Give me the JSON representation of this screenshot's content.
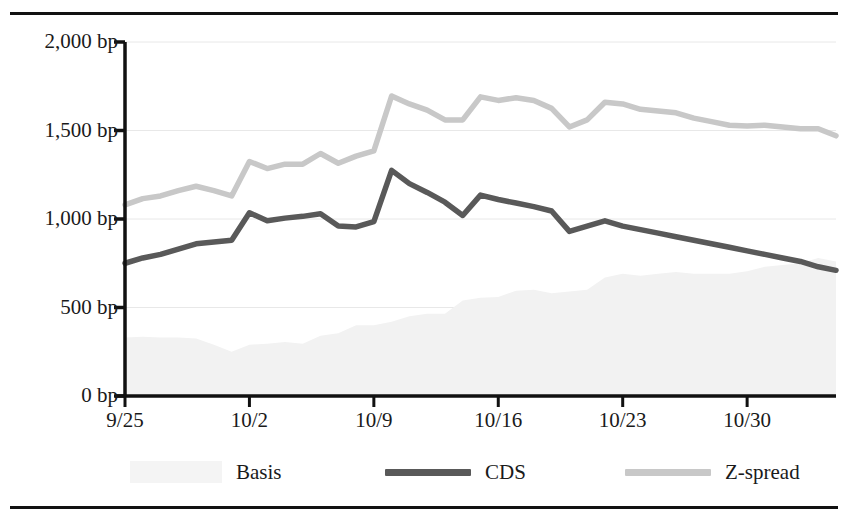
{
  "chart_data": {
    "type": "line",
    "title": "",
    "subtitle": "",
    "xlabel": "",
    "ylabel": "",
    "ylim": [
      0,
      2000
    ],
    "grid": true,
    "legend_position": "bottom",
    "y_ticks": [
      0,
      500,
      1000,
      1500,
      2000
    ],
    "y_tick_labels": [
      "0 bp",
      "500 bp",
      "1,000 bp",
      "1,500 bp",
      "2,000 bp"
    ],
    "x_ticks": [
      0,
      7,
      14,
      21,
      28,
      35
    ],
    "x_tick_labels": [
      "9/25",
      "10/2",
      "10/9",
      "10/16",
      "10/23",
      "10/30"
    ],
    "x_unit": "days since 9/25",
    "x_range": [
      0,
      40
    ],
    "x": [
      0,
      1,
      2,
      3,
      4,
      5,
      6,
      7,
      8,
      9,
      10,
      11,
      12,
      13,
      14,
      15,
      16,
      17,
      18,
      19,
      20,
      21,
      22,
      23,
      24,
      25,
      26,
      27,
      28,
      29,
      30,
      31,
      32,
      33,
      34,
      35,
      36,
      37,
      38,
      39,
      40
    ],
    "series": [
      {
        "name": "Basis",
        "type": "area",
        "color": "#f2f2f2",
        "note": "Z-spread minus CDS, shown as a very faint shaded area",
        "values": [
          330,
          335,
          330,
          330,
          325,
          290,
          250,
          290,
          295,
          305,
          295,
          340,
          355,
          400,
          400,
          420,
          450,
          465,
          465,
          540,
          555,
          560,
          595,
          600,
          580,
          590,
          600,
          670,
          690,
          680,
          690,
          700,
          690,
          690,
          690,
          705,
          730,
          740,
          750,
          780,
          760
        ]
      },
      {
        "name": "CDS",
        "type": "line",
        "color": "#595959",
        "values": [
          750,
          780,
          800,
          830,
          860,
          870,
          880,
          1035,
          990,
          1005,
          1015,
          1030,
          960,
          955,
          985,
          1275,
          1200,
          1150,
          1095,
          1020,
          1135,
          1110,
          1090,
          1070,
          1045,
          930,
          960,
          990,
          960,
          940,
          920,
          900,
          880,
          860,
          840,
          820,
          800,
          780,
          760,
          730,
          710
        ]
      },
      {
        "name": "Z-spread",
        "type": "line",
        "color": "#c8c8c8",
        "values": [
          1080,
          1115,
          1130,
          1160,
          1185,
          1160,
          1130,
          1325,
          1285,
          1310,
          1310,
          1370,
          1315,
          1355,
          1385,
          1695,
          1650,
          1615,
          1560,
          1560,
          1690,
          1670,
          1685,
          1670,
          1625,
          1520,
          1560,
          1660,
          1650,
          1620,
          1610,
          1600,
          1570,
          1550,
          1530,
          1525,
          1530,
          1520,
          1510,
          1510,
          1470
        ]
      }
    ]
  },
  "legend": {
    "items": [
      {
        "label": "Basis",
        "color": "#f4f4f4",
        "style": "area"
      },
      {
        "label": "CDS",
        "color": "#595959",
        "style": "line"
      },
      {
        "label": "Z-spread",
        "color": "#c8c8c8",
        "style": "line"
      }
    ]
  }
}
